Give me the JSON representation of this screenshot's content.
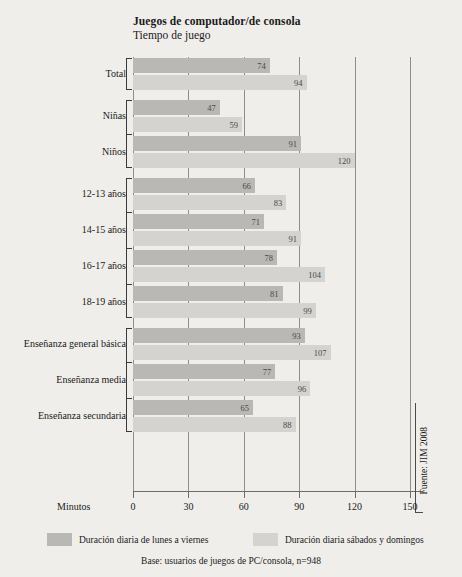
{
  "title": {
    "main": "Juegos de computador/de consola",
    "sub": "Tiempo de juego"
  },
  "axis": {
    "x_label": "Minutos",
    "ticks": [
      "0",
      "30",
      "60",
      "90",
      "120",
      "150"
    ]
  },
  "legend": {
    "weekday": "Duración diaria de lunes a viernes",
    "weekend": "Duración diaria sábados y domingos"
  },
  "base_note": "Base: usuarios de juegos de PC/consola, n=948",
  "source": "Fuente: JIM 2008",
  "colors": {
    "weekday": "#b9b8b4",
    "weekend": "#d4d3cf",
    "background": "#efeeea",
    "axis": "#6d6c68"
  },
  "chart_data": {
    "type": "bar",
    "orientation": "horizontal",
    "xlabel": "Minutos",
    "ylabel": "",
    "xlim": [
      0,
      150
    ],
    "xticks": [
      0,
      30,
      60,
      90,
      120,
      150
    ],
    "grid": true,
    "legend_position": "bottom",
    "categories": [
      "Total",
      "Niñas",
      "Niños",
      "12-13 años",
      "14-15 años",
      "16-17 años",
      "18-19 años",
      "Enseñanza general básica",
      "Enseñanza media",
      "Enseñanza secundaria"
    ],
    "series": [
      {
        "name": "Duración diaria de lunes a viernes",
        "color": "#b9b8b4",
        "values": [
          74,
          47,
          91,
          66,
          71,
          78,
          81,
          93,
          77,
          65
        ]
      },
      {
        "name": "Duración diaria sábados y domingos",
        "color": "#d4d3cf",
        "values": [
          94,
          59,
          120,
          83,
          91,
          104,
          99,
          107,
          96,
          88
        ]
      }
    ],
    "annotations": [
      "Base: usuarios de juegos de PC/consola, n=948",
      "Fuente: JIM 2008"
    ]
  }
}
